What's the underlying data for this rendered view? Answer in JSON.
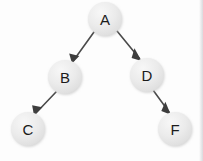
{
  "diagram": {
    "type": "tree",
    "colors": {
      "background": "#fdfdfd",
      "node_fill": "#e9e9e9",
      "node_fill_highlight": "#f6f6f6",
      "node_shadow": "#cfcfcf",
      "label_text": "#1b1b1b",
      "edge_stroke": "#4a4a4a",
      "arrow_fill": "#3d3d3d"
    },
    "nodes": [
      {
        "id": "A",
        "label": "A",
        "cx": 105,
        "cy": 19,
        "r": 17
      },
      {
        "id": "B",
        "label": "B",
        "cx": 65,
        "cy": 77,
        "r": 17
      },
      {
        "id": "D",
        "label": "D",
        "cx": 147,
        "cy": 75,
        "r": 17
      },
      {
        "id": "C",
        "label": "C",
        "cx": 28,
        "cy": 129,
        "r": 17
      },
      {
        "id": "F",
        "label": "F",
        "cx": 175,
        "cy": 129,
        "r": 17
      }
    ],
    "edges": [
      {
        "id": "A-B",
        "from": "A",
        "to": "B",
        "x1": 94,
        "y1": 32,
        "x2": 73,
        "y2": 61,
        "directed": true
      },
      {
        "id": "A-D",
        "from": "A",
        "to": "D",
        "x1": 117,
        "y1": 31,
        "x2": 140,
        "y2": 59,
        "directed": true
      },
      {
        "id": "B-C",
        "from": "B",
        "to": "C",
        "x1": 56,
        "y1": 92,
        "x2": 35,
        "y2": 114,
        "directed": true
      },
      {
        "id": "D-F",
        "from": "D",
        "to": "F",
        "x1": 153,
        "y1": 90,
        "x2": 170,
        "y2": 113,
        "directed": true
      }
    ],
    "artifacts": {
      "ghost_text_left": "",
      "ghost_text_right": ""
    }
  }
}
